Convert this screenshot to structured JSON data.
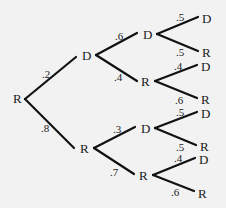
{
  "diagram": {
    "type": "probability-tree",
    "background": "#f2f2f2",
    "line_color": "#111111",
    "root": {
      "label": "R"
    },
    "level1": [
      {
        "label": "D",
        "prob": ".2"
      },
      {
        "label": "R",
        "prob": ".8"
      }
    ],
    "level2": [
      {
        "parent": "D",
        "label": "D",
        "prob": ".6"
      },
      {
        "parent": "D",
        "label": "R",
        "prob": ".4"
      },
      {
        "parent": "R",
        "label": "D",
        "prob": ".3"
      },
      {
        "parent": "R",
        "label": "R",
        "prob": ".7"
      }
    ],
    "level3": [
      {
        "label": "D",
        "prob": ".5"
      },
      {
        "label": "R",
        "prob": ".5"
      },
      {
        "label": "D",
        "prob": ".4"
      },
      {
        "label": "R",
        "prob": ".6"
      },
      {
        "label": "D",
        "prob": ".5"
      },
      {
        "label": "R",
        "prob": ".5"
      },
      {
        "label": "D",
        "prob": ".4"
      },
      {
        "label": "R",
        "prob": ".6"
      }
    ]
  }
}
